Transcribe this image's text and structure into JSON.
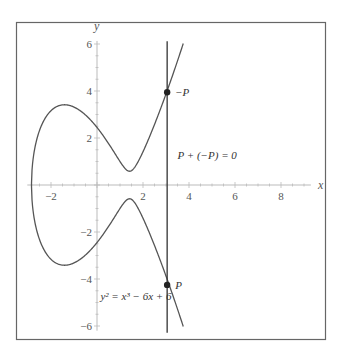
{
  "chart_data": {
    "type": "line",
    "title": "",
    "xlabel": "x",
    "ylabel": "y",
    "xlim": [
      -2.9,
      9.3
    ],
    "ylim": [
      -6.2,
      6.3
    ],
    "grid": false,
    "x_ticks": [
      -2,
      2,
      4,
      6,
      8
    ],
    "x_tick_labels": [
      "−2",
      "2",
      "4",
      "6",
      "8"
    ],
    "y_ticks": [
      -6,
      -4,
      -2,
      2,
      4,
      6
    ],
    "y_tick_labels": [
      "−6",
      "−4",
      "−2",
      "2",
      "4",
      "6"
    ],
    "curve": {
      "name": "elliptic curve",
      "equation_label": "y² = x³ − 6x + 6",
      "coefficients": {
        "a": -6,
        "b": 6
      },
      "x_range": [
        -2.847,
        3.75
      ]
    },
    "vertical_line": {
      "x": 3.05,
      "y_range": [
        -6.2,
        6.2
      ]
    },
    "points": [
      {
        "name": "-P",
        "label": "−P",
        "x": 3.05,
        "y": 3.95
      },
      {
        "name": "P",
        "label": "P",
        "x": 3.05,
        "y": -4.25
      }
    ],
    "annotations": [
      {
        "text": "P + (−P) = 0",
        "x": 3.5,
        "y": 1.1
      },
      {
        "text": "y² = x³ − 6x + 6",
        "x": 0.15,
        "y": -4.9
      }
    ],
    "colors": {
      "curve": "#555555",
      "line": "#333333",
      "axis": "#bbbbbb",
      "frame": "#666666",
      "point": "#222222"
    }
  }
}
